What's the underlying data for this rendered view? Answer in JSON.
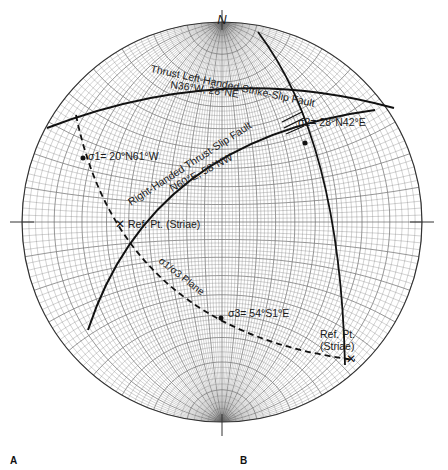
{
  "north_label": "N",
  "faults": {
    "thrust_left": {
      "name": "Thrust Left-Handed Strike-Slip Fault",
      "orientation": "N36°W, 28°NE"
    },
    "right_thrust": {
      "name": "Right-Handed Thrust-Slip Fault",
      "orientation": "N60°E, 58°NW"
    }
  },
  "stresses": {
    "sigma1": {
      "symbol": "σ1",
      "value": "20°N61°W",
      "text": "σ1= 20°N61°W"
    },
    "sigma2": {
      "symbol": "σ2",
      "value": "28°N42°E",
      "text": "σ2= 28°N42°E"
    },
    "sigma3": {
      "symbol": "σ3",
      "value": "54°S1°E",
      "text": "σ3= 54°S1°E"
    }
  },
  "plane_label": "σ1/σ3 Plane",
  "ref_points": {
    "left": "Ref. Pt. (Striae)",
    "right_line1": "Ref. Pt.",
    "right_line2": "(Striae)"
  },
  "panels": {
    "a": "A",
    "b": "B"
  },
  "colors": {
    "grid": "#555555",
    "line": "#111111",
    "background": "#ffffff"
  }
}
